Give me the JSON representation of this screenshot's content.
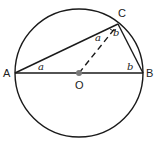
{
  "diagram": {
    "points": {
      "A": {
        "label": "A",
        "x": 15,
        "y": 73
      },
      "B": {
        "label": "B",
        "x": 143,
        "y": 73
      },
      "C": {
        "label": "C",
        "x": 118,
        "y": 24
      },
      "O": {
        "label": "O",
        "x": 79,
        "y": 73
      }
    },
    "circle": {
      "cx": 79,
      "cy": 73,
      "r": 64
    },
    "angle_labels": {
      "at_A": "a",
      "at_B": "b",
      "at_C_left": "a",
      "at_C_right": "b"
    },
    "colors": {
      "stroke": "#1a1a1a",
      "center_dot": "#7a7a7a",
      "dashed": "#1a1a1a"
    }
  }
}
